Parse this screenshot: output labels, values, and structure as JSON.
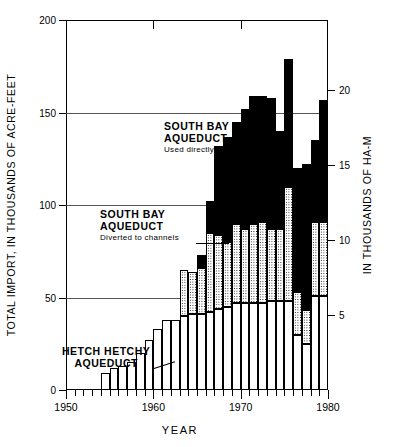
{
  "axes": {
    "left_title": "TOTAL IMPORT, IN THOUSANDS OF ACRE-FEET",
    "right_title": "IN THOUSANDS OF HA-M",
    "x_title": "YEAR",
    "left_ticks": [
      "0",
      "50",
      "100",
      "150",
      "200"
    ],
    "right_ticks": [
      "5",
      "10",
      "15",
      "20"
    ],
    "x_ticks": [
      "1950",
      "1960",
      "1970",
      "1980"
    ]
  },
  "annotations": {
    "direct": {
      "line1": "SOUTH BAY",
      "line2": "AQUEDUCT",
      "line3": "Used directly"
    },
    "diverted": {
      "line1": "SOUTH BAY",
      "line2": "AQUEDUCT",
      "line3": "Diverted to channels"
    },
    "hetch": {
      "line1": "HETCH  HETCHY",
      "line2": "AQUEDUCT"
    }
  },
  "chart_data": {
    "type": "bar",
    "title": "",
    "xlabel": "YEAR",
    "ylabel": "TOTAL IMPORT, IN THOUSANDS OF ACRE-FEET",
    "ylabel_right": "IN THOUSANDS OF HA-M",
    "stacked": true,
    "grid": true,
    "legend": "annotations-inline",
    "xlim": [
      1950,
      1980
    ],
    "ylim": [
      0,
      200
    ],
    "ylim_right": [
      0,
      24.67
    ],
    "yticks": [
      0,
      50,
      100,
      150,
      200
    ],
    "yticks_right": [
      5,
      10,
      15,
      20
    ],
    "xticks": [
      1950,
      1960,
      1970,
      1980
    ],
    "categories": [
      1955,
      1956,
      1957,
      1958,
      1959,
      1960,
      1961,
      1962,
      1963,
      1964,
      1965,
      1966,
      1967,
      1968,
      1969,
      1970,
      1971,
      1972,
      1973,
      1974,
      1975,
      1976,
      1977,
      1978,
      1979,
      1980
    ],
    "series": [
      {
        "name": "HETCH HETCHY AQUEDUCT",
        "fill": "white",
        "values": [
          9,
          12,
          13,
          15,
          20,
          27,
          33,
          38,
          38,
          40,
          41,
          41,
          42,
          44,
          45,
          47,
          47,
          47,
          47,
          48,
          48,
          48,
          30,
          25,
          51,
          51
        ]
      },
      {
        "name": "SOUTH BAY AQUEDUCT - Diverted to channels",
        "fill": "stippled",
        "values": [
          0,
          0,
          0,
          0,
          0,
          0,
          0,
          0,
          0,
          25,
          23,
          25,
          43,
          40,
          35,
          43,
          40,
          43,
          44,
          39,
          39,
          62,
          23,
          18,
          40,
          40
        ]
      },
      {
        "name": "SOUTH BAY AQUEDUCT - Used directly",
        "fill": "black",
        "values": [
          0,
          0,
          0,
          0,
          0,
          0,
          0,
          0,
          0,
          0,
          0,
          7,
          17,
          48,
          57,
          55,
          65,
          69,
          68,
          71,
          53,
          69,
          67,
          79,
          44,
          66
        ]
      }
    ],
    "colors": {
      "direct": "#000000",
      "diverted": "#aaaaaa",
      "hetch": "#ffffff"
    }
  }
}
